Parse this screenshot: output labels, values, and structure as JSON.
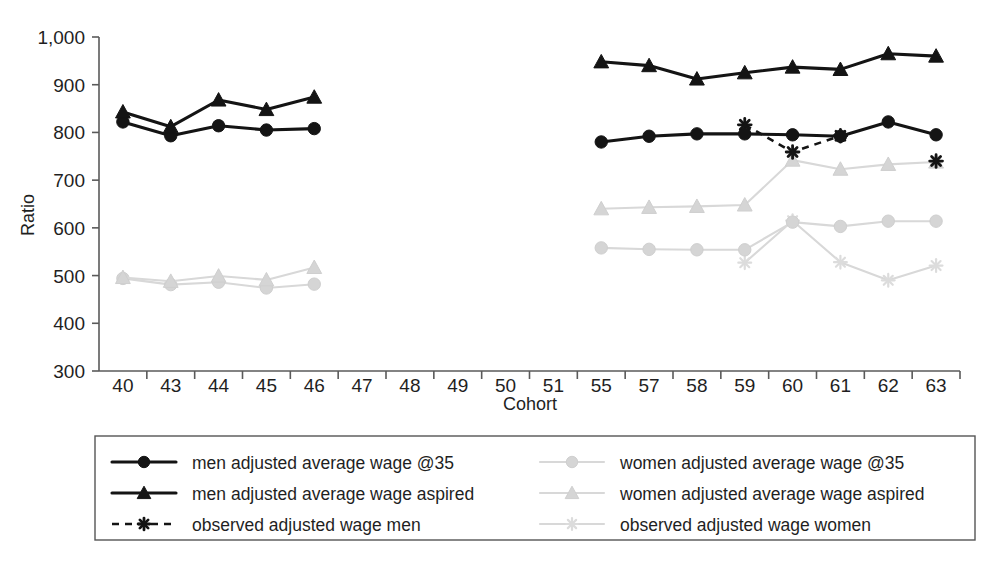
{
  "chart_data": {
    "type": "line",
    "title": "",
    "xlabel": "Cohort",
    "ylabel": "Ratio",
    "ylim": [
      300,
      1000
    ],
    "ytick_labels": [
      "300",
      "400",
      "500",
      "600",
      "700",
      "800",
      "900",
      "1,000"
    ],
    "yticks": [
      300,
      400,
      500,
      600,
      700,
      800,
      900,
      1000
    ],
    "grid": false,
    "legend_position": "bottom",
    "categories": [
      "40",
      "43",
      "44",
      "45",
      "46",
      "47",
      "48",
      "49",
      "50",
      "51",
      "55",
      "57",
      "58",
      "59",
      "60",
      "61",
      "62",
      "63"
    ],
    "series": [
      {
        "name": "men adjusted average wage @35",
        "marker": "circle",
        "line": "solid",
        "color": "#141414",
        "values": [
          822,
          793,
          814,
          805,
          808,
          null,
          null,
          null,
          null,
          null,
          780,
          792,
          797,
          797,
          795,
          792,
          822,
          795
        ]
      },
      {
        "name": "men adjusted average wage aspired",
        "marker": "triangle",
        "line": "solid",
        "color": "#141414",
        "values": [
          843,
          812,
          868,
          848,
          874,
          null,
          null,
          null,
          null,
          null,
          948,
          940,
          912,
          925,
          937,
          932,
          965,
          960
        ]
      },
      {
        "name": "observed adjusted wage men",
        "marker": "asterisk",
        "line": "dashed",
        "color": "#141414",
        "values": [
          null,
          null,
          null,
          null,
          null,
          null,
          null,
          null,
          null,
          null,
          null,
          null,
          null,
          816,
          759,
          793,
          null,
          740
        ]
      },
      {
        "name": "women adjusted average wage @35",
        "marker": "circle",
        "line": "solid",
        "color": "#d5d5d5",
        "values": [
          494,
          481,
          486,
          474,
          482,
          null,
          null,
          null,
          null,
          null,
          558,
          555,
          554,
          554,
          612,
          603,
          614,
          614
        ]
      },
      {
        "name": "women adjusted average wage aspired",
        "marker": "triangle",
        "line": "solid",
        "color": "#d5d5d5",
        "values": [
          496,
          488,
          499,
          491,
          517,
          null,
          null,
          null,
          null,
          null,
          640,
          643,
          645,
          648,
          742,
          723,
          733,
          738
        ]
      },
      {
        "name": "observed adjusted wage women",
        "marker": "asterisk",
        "line": "solid",
        "color": "#dcdcdc",
        "values": [
          null,
          null,
          null,
          null,
          null,
          null,
          null,
          null,
          null,
          null,
          null,
          null,
          null,
          527,
          615,
          528,
          490,
          521
        ]
      }
    ]
  },
  "axis": {
    "y_title": "Ratio",
    "x_title": "Cohort"
  },
  "legend": {
    "left_column": [
      {
        "label": "men adjusted average wage @35",
        "marker": "circle",
        "line": "solid",
        "tone": "dark"
      },
      {
        "label": "men adjusted average wage aspired",
        "marker": "triangle",
        "line": "solid",
        "tone": "dark"
      },
      {
        "label": "observed adjusted wage men",
        "marker": "asterisk",
        "line": "dashed",
        "tone": "dark"
      }
    ],
    "right_column": [
      {
        "label": "women adjusted average wage @35",
        "marker": "circle",
        "line": "solid",
        "tone": "light"
      },
      {
        "label": "women adjusted average wage aspired",
        "marker": "triangle",
        "line": "solid",
        "tone": "light"
      },
      {
        "label": "observed adjusted wage women",
        "marker": "asterisk",
        "line": "solid",
        "tone": "light"
      }
    ]
  },
  "colors": {
    "dark_series": "#141414",
    "light_series": "#d5d5d5",
    "axis": "#5a5a5a",
    "text": "#1f1f1f",
    "background": "#ffffff"
  }
}
